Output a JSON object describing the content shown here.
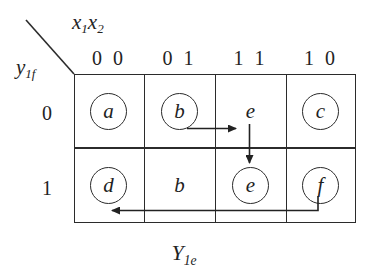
{
  "diagram": {
    "type": "karnaugh-flow-table",
    "column_variable_label": "x",
    "column_variable_sub": "1",
    "column_variable_label2": "x",
    "column_variable_sub2": "2",
    "row_variable_label": "y",
    "row_variable_sub": "1f",
    "output_label": "Y",
    "output_sub": "1e",
    "column_headers": [
      "0 0",
      "0 1",
      "1 1",
      "1 0"
    ],
    "row_headers": [
      "0",
      "1"
    ],
    "cells": [
      {
        "row": 0,
        "col": 0,
        "value": "a",
        "circled": true
      },
      {
        "row": 0,
        "col": 1,
        "value": "b",
        "circled": true
      },
      {
        "row": 0,
        "col": 2,
        "value": "e",
        "circled": false
      },
      {
        "row": 0,
        "col": 3,
        "value": "c",
        "circled": true
      },
      {
        "row": 1,
        "col": 0,
        "value": "d",
        "circled": true
      },
      {
        "row": 1,
        "col": 1,
        "value": "b",
        "circled": false
      },
      {
        "row": 1,
        "col": 2,
        "value": "e",
        "circled": true
      },
      {
        "row": 1,
        "col": 3,
        "value": "f",
        "circled": true
      }
    ],
    "arrows": [
      {
        "name": "arrow-b-to-e-right",
        "direction": "right",
        "from_cell": "row0-col1",
        "to_cell": "row0-col2"
      },
      {
        "name": "arrow-e-to-e-down",
        "direction": "down",
        "from_cell": "row0-col2",
        "to_cell": "row1-col2"
      },
      {
        "name": "arrow-f-to-d-left",
        "direction": "left",
        "from_cell": "row1-col3",
        "to_cell": "row1-col0"
      }
    ],
    "colors": {
      "ink": "#232323",
      "line": "#2b2b2b",
      "background": "#ffffff"
    }
  }
}
